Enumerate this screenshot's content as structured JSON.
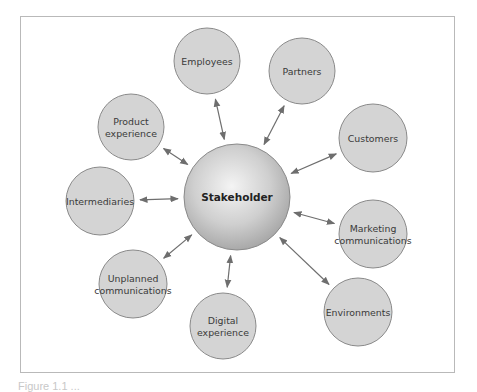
{
  "diagram": {
    "center": {
      "label": "Stakeholder",
      "cx": 237,
      "cy": 197,
      "r": 53
    },
    "nodes": [
      {
        "id": "employees",
        "lines": [
          "Employees"
        ],
        "cx": 207,
        "cy": 61,
        "r": 33
      },
      {
        "id": "partners",
        "lines": [
          "Partners"
        ],
        "cx": 302,
        "cy": 71,
        "r": 33
      },
      {
        "id": "product-experience",
        "lines": [
          "Product",
          "experience"
        ],
        "cx": 131,
        "cy": 127,
        "r": 33
      },
      {
        "id": "customers",
        "lines": [
          "Customers"
        ],
        "cx": 373,
        "cy": 138,
        "r": 34
      },
      {
        "id": "intermediaries",
        "lines": [
          "Intermediaries"
        ],
        "cx": 100,
        "cy": 201,
        "r": 34
      },
      {
        "id": "marketing-communications",
        "lines": [
          "Marketing",
          "communications"
        ],
        "cx": 373,
        "cy": 234,
        "r": 34
      },
      {
        "id": "unplanned-communications",
        "lines": [
          "Unplanned",
          "communications"
        ],
        "cx": 133,
        "cy": 284,
        "r": 34
      },
      {
        "id": "digital-experience",
        "lines": [
          "Digital",
          "experience"
        ],
        "cx": 223,
        "cy": 326,
        "r": 33
      },
      {
        "id": "environments",
        "lines": [
          "Environments"
        ],
        "cx": 358,
        "cy": 312,
        "r": 34
      }
    ],
    "colors": {
      "node_fill": "#d4d4d4",
      "node_stroke": "#8a8a8a",
      "arrow": "#6e6e6e",
      "frame": "#b9b9b9"
    },
    "connection": "bidirectional-arrow"
  },
  "caption": {
    "text": "Figure 1.1 ..."
  }
}
